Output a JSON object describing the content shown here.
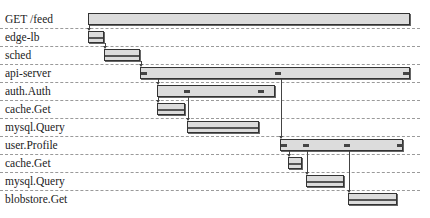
{
  "scale": {
    "x0": 88,
    "x1": 410
  },
  "spans": [
    {
      "id": 0,
      "label": "GET /feed",
      "start": 88,
      "end": 410,
      "style": "plain",
      "parent": null
    },
    {
      "id": 1,
      "label": "edge-lb",
      "start": 88,
      "end": 104,
      "style": "striped",
      "parent": 0
    },
    {
      "id": 2,
      "label": "sched",
      "start": 104,
      "end": 140,
      "style": "striped",
      "parent": 1
    },
    {
      "id": 3,
      "label": "api-server",
      "start": 140,
      "end": 410,
      "style": "plain",
      "parent": 2,
      "ticks": [
        141,
        275,
        403
      ]
    },
    {
      "id": 4,
      "label": "auth.Auth",
      "start": 157,
      "end": 275,
      "style": "plain",
      "parent": 3,
      "ticks": [
        184,
        258
      ]
    },
    {
      "id": 5,
      "label": "cache.Get",
      "start": 157,
      "end": 185,
      "style": "striped",
      "parent": 4
    },
    {
      "id": 6,
      "label": "mysql.Query",
      "start": 187,
      "end": 259,
      "style": "striped",
      "parent": 4
    },
    {
      "id": 7,
      "label": "user.Profile",
      "start": 280,
      "end": 403,
      "style": "plain",
      "parent": 3,
      "ticks": [
        281,
        303,
        344,
        397
      ]
    },
    {
      "id": 8,
      "label": "cache.Get",
      "start": 288,
      "end": 302,
      "style": "striped",
      "parent": 7
    },
    {
      "id": 9,
      "label": "mysql.Query",
      "start": 306,
      "end": 344,
      "style": "striped",
      "parent": 7
    },
    {
      "id": 10,
      "label": "blobstore.Get",
      "start": 348,
      "end": 397,
      "style": "striped",
      "parent": 7
    }
  ]
}
